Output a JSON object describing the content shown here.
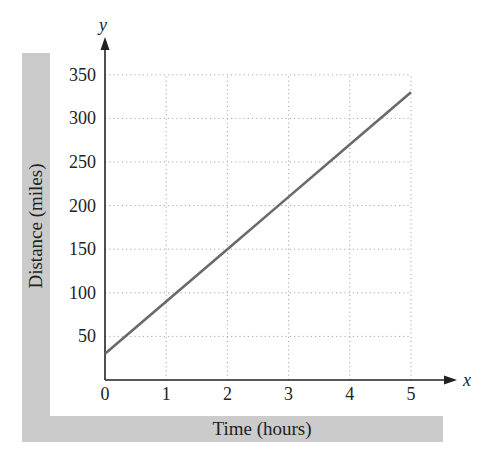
{
  "chart_data": {
    "type": "line",
    "title": "",
    "xlabel": "Time (hours)",
    "ylabel": "Distance (miles)",
    "x_axis_name": "x",
    "y_axis_name": "y",
    "x_ticks": [
      "0",
      "1",
      "2",
      "3",
      "4",
      "5"
    ],
    "y_ticks": [
      "50",
      "100",
      "150",
      "200",
      "250",
      "300",
      "350"
    ],
    "xlim": [
      0,
      5
    ],
    "ylim": [
      0,
      350
    ],
    "grid": true,
    "grid_style": "dotted",
    "legend": null,
    "series": [
      {
        "name": "distance",
        "x": [
          0,
          1,
          2,
          3,
          4,
          5
        ],
        "values": [
          30,
          90,
          150,
          210,
          270,
          330
        ]
      }
    ]
  },
  "colors": {
    "line": "#6a6a6a",
    "panel": "#cbcbcb",
    "grid": "#a8a8a8",
    "axis": "#222222"
  }
}
